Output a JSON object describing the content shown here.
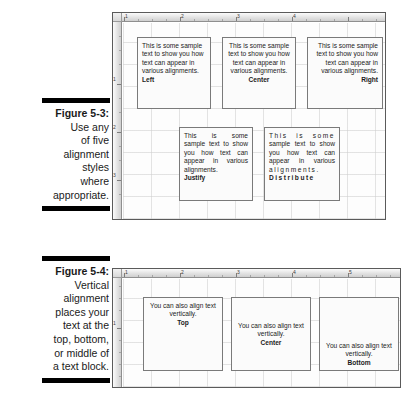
{
  "figures": [
    {
      "id": "figure-5-3",
      "caption": {
        "figure_number": "Figure 5-3:",
        "lines": [
          "Use any",
          "of five",
          "alignment",
          "styles",
          "where",
          "appropriate."
        ]
      },
      "ruler": {
        "h_numbers": [
          "1",
          "2",
          "3",
          "4"
        ],
        "v_numbers": [
          "1",
          "2",
          "3"
        ]
      },
      "boxes": [
        {
          "name": "left",
          "alignment": "Left",
          "label": "Left",
          "lines": [
            "This is some",
            "sample text to show",
            "you how text can",
            "appear in various",
            "alignments."
          ]
        },
        {
          "name": "center",
          "alignment": "Center",
          "label": "Center",
          "lines": [
            "This is some",
            "sample text to show",
            "you how text can",
            "appear in various",
            "alignments."
          ]
        },
        {
          "name": "right",
          "alignment": "Right",
          "label": "Right",
          "lines": [
            "This is some",
            "sample text to show",
            "you how text can",
            "appear in various",
            "alignments."
          ]
        },
        {
          "name": "justify",
          "alignment": "Justify",
          "label": "Justify",
          "lines": [
            "This is some",
            "sample text to show",
            "you how text can",
            "appear in various",
            "alignments."
          ]
        },
        {
          "name": "distribute",
          "alignment": "Distribute",
          "label": "Distribute",
          "lines": [
            "This is some",
            "sample text to show",
            "you how text can",
            "appear in various",
            "alignments."
          ]
        }
      ]
    },
    {
      "id": "figure-5-4",
      "caption": {
        "figure_number": "Figure 5-4:",
        "lines": [
          "Vertical",
          "alignment",
          "places your",
          "text at the",
          "top, bottom,",
          "or middle of",
          "a text block."
        ]
      },
      "ruler": {
        "h_numbers": [
          "1",
          "2",
          "3",
          "4",
          "5"
        ],
        "v_numbers": [
          "1"
        ]
      },
      "boxes": [
        {
          "name": "top",
          "alignment": "Top",
          "label": "Top",
          "lines": [
            "You can also align",
            "text vertically."
          ]
        },
        {
          "name": "center",
          "alignment": "Center",
          "label": "Center",
          "lines": [
            "You can also align",
            "text vertically."
          ]
        },
        {
          "name": "bottom",
          "alignment": "Bottom",
          "label": "Bottom",
          "lines": [
            "You can also align",
            "text vertically."
          ]
        }
      ]
    }
  ],
  "colors": {
    "caption_bar": "#000000",
    "panel_border": "#5a5a5a",
    "box_border": "#7a7a7a",
    "text": "#1b1b1b"
  }
}
